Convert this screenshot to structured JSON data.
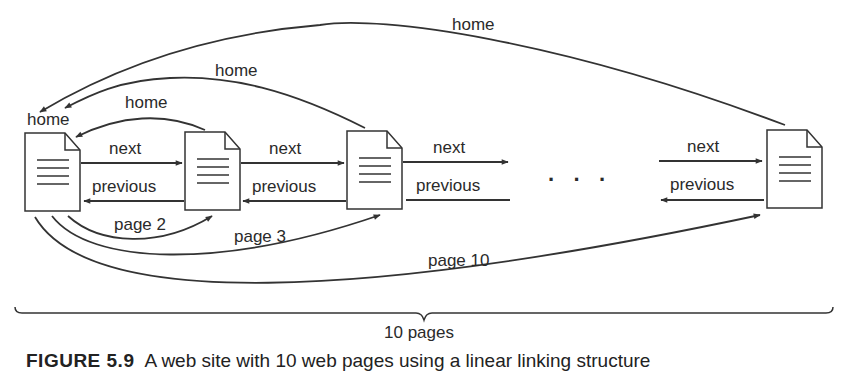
{
  "diagram": {
    "type": "linear-linking-structure",
    "pages": [
      {
        "id": "page-1",
        "role": "home"
      },
      {
        "id": "page-2"
      },
      {
        "id": "page-3"
      },
      {
        "id": "page-10"
      }
    ],
    "labels": {
      "home_top": "home",
      "home_middle": "home",
      "home_inner": "home",
      "home_page_label": "home",
      "next_1": "next",
      "next_2": "next",
      "next_3": "next",
      "next_4": "next",
      "previous_1": "previous",
      "previous_2": "previous",
      "previous_3": "previous",
      "previous_4": "previous",
      "page_2": "page 2",
      "page_3": "page 3",
      "page_10": "page 10",
      "ellipsis": "· · ·",
      "brace_label": "10 pages"
    },
    "edges": [
      {
        "from": "page-2",
        "to": "page-1",
        "label": "home"
      },
      {
        "from": "page-3",
        "to": "page-1",
        "label": "home"
      },
      {
        "from": "page-10",
        "to": "page-1",
        "label": "home"
      },
      {
        "from": "page-1",
        "to": "page-2",
        "label": "next"
      },
      {
        "from": "page-2",
        "to": "page-3",
        "label": "next"
      },
      {
        "from": "page-2",
        "to": "page-1",
        "label": "previous"
      },
      {
        "from": "page-3",
        "to": "page-2",
        "label": "previous"
      },
      {
        "from": "page-1",
        "to": "page-2",
        "label": "page 2"
      },
      {
        "from": "page-1",
        "to": "page-3",
        "label": "page 3"
      },
      {
        "from": "page-1",
        "to": "page-10",
        "label": "page 10"
      }
    ],
    "line_color": "#333333"
  },
  "caption": {
    "figure_number": "FIGURE 5.9",
    "text": "A web site with 10 web pages using a linear linking structure"
  }
}
